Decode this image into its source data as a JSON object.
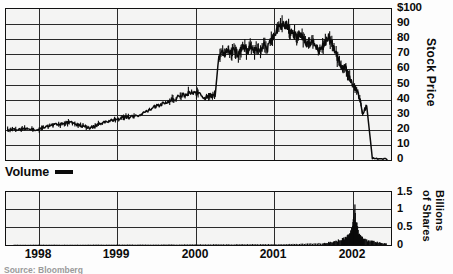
{
  "legend": {
    "label": "Volume",
    "swatch_name": "volume-line-swatch"
  },
  "source": {
    "text": "Source: Bloomberg"
  },
  "price_axis": {
    "title": "Stock Price",
    "ticks": [
      "$100",
      "90",
      "80",
      "70",
      "60",
      "50",
      "40",
      "30",
      "20",
      "10",
      "0"
    ]
  },
  "volume_axis": {
    "title_line1": "Billions",
    "title_line2": "of Shares",
    "ticks": [
      "1.5",
      "1",
      "0.5",
      "0"
    ]
  },
  "x_axis": {
    "ticks": [
      "1998",
      "1999",
      "2000",
      "2001",
      "2002"
    ]
  },
  "colors": {
    "ink": "#0b0b0b",
    "grid": "#2a2a2a",
    "plot_background": "#f4f4f3",
    "page_background": "#fdfdfd"
  },
  "chart_data": [
    {
      "type": "line",
      "title": "Stock Price",
      "xlabel": "",
      "ylabel": "Stock Price",
      "xlim": [
        1997.6,
        2002.35
      ],
      "ylim": [
        0,
        100
      ],
      "grid": true,
      "legend_position": "below-plot-left",
      "yticks": [
        0,
        10,
        20,
        30,
        40,
        50,
        60,
        70,
        80,
        90,
        100
      ],
      "ytick_labels": [
        "0",
        "10",
        "20",
        "30",
        "40",
        "50",
        "60",
        "70",
        "80",
        "90",
        "$100"
      ],
      "xticks": [
        1998,
        1999,
        2000,
        2001,
        2002
      ],
      "xtick_labels": [
        "1998",
        "1999",
        "2000",
        "2001",
        "2002"
      ],
      "series": [
        {
          "name": "Stock Price",
          "x": [
            1997.62,
            1997.68,
            1997.74,
            1997.8,
            1997.86,
            1997.92,
            1997.98,
            1998.04,
            1998.1,
            1998.16,
            1998.22,
            1998.28,
            1998.34,
            1998.4,
            1998.46,
            1998.52,
            1998.58,
            1998.64,
            1998.7,
            1998.76,
            1998.82,
            1998.88,
            1998.94,
            1999.0,
            1999.06,
            1999.12,
            1999.18,
            1999.24,
            1999.3,
            1999.36,
            1999.42,
            1999.48,
            1999.54,
            1999.6,
            1999.66,
            1999.72,
            1999.78,
            1999.84,
            1999.9,
            1999.96,
            2000.02,
            2000.06,
            2000.1,
            2000.14,
            2000.18,
            2000.22,
            2000.26,
            2000.3,
            2000.34,
            2000.38,
            2000.42,
            2000.46,
            2000.5,
            2000.54,
            2000.58,
            2000.62,
            2000.66,
            2000.7,
            2000.74,
            2000.78,
            2000.82,
            2000.86,
            2000.9,
            2000.94,
            2000.98,
            2001.02,
            2001.06,
            2001.1,
            2001.14,
            2001.18,
            2001.22,
            2001.26,
            2001.3,
            2001.34,
            2001.38,
            2001.42,
            2001.46,
            2001.5,
            2001.54,
            2001.58,
            2001.62,
            2001.66,
            2001.7,
            2001.74,
            2001.78,
            2001.82,
            2001.86,
            2001.9,
            2001.94,
            2001.97,
            2002.0,
            2002.05,
            2002.12,
            2002.2,
            2002.3
          ],
          "y": [
            20,
            20.5,
            20,
            20.5,
            21,
            20.5,
            20,
            21,
            22,
            23,
            24,
            23.5,
            24.5,
            25,
            24,
            23,
            22,
            21,
            22.5,
            24,
            25,
            26,
            27,
            27.5,
            28,
            28.5,
            29,
            30,
            31.5,
            33,
            35,
            36,
            37.5,
            39,
            40,
            41.5,
            43,
            44,
            45,
            44,
            42.5,
            41,
            42,
            43,
            42,
            66,
            72,
            70,
            73,
            71,
            74,
            70,
            73,
            76,
            72,
            75,
            71,
            74,
            72,
            76,
            73,
            78,
            82,
            86,
            88,
            89,
            90,
            86,
            84,
            81,
            83,
            80,
            78,
            76,
            79,
            75,
            72,
            74,
            78,
            81,
            77,
            72,
            66,
            60,
            63,
            56,
            52,
            48,
            44,
            39,
            30,
            36,
            1,
            0.5,
            0.4,
            0.3
          ]
        }
      ]
    },
    {
      "type": "bar",
      "title": "Volume",
      "xlabel": "",
      "ylabel": "Billions of Shares",
      "xlim": [
        1997.6,
        2002.35
      ],
      "ylim": [
        0,
        1.5
      ],
      "grid": true,
      "yticks": [
        0,
        0.5,
        1,
        1.5
      ],
      "ytick_labels": [
        "0",
        "0.5",
        "1",
        "1.5"
      ],
      "xticks": [
        1998,
        1999,
        2000,
        2001,
        2002
      ],
      "xtick_labels": [
        "1998",
        "1999",
        "2000",
        "2001",
        "2002"
      ],
      "series": [
        {
          "name": "Volume",
          "x": [
            1997.7,
            1997.8,
            1997.9,
            1998.0,
            1998.1,
            1998.2,
            1998.3,
            1998.4,
            1998.5,
            1998.6,
            1998.7,
            1998.8,
            1998.9,
            1999.0,
            1999.1,
            1999.2,
            1999.3,
            1999.4,
            1999.5,
            1999.6,
            1999.7,
            1999.8,
            1999.9,
            2000.0,
            2000.1,
            2000.2,
            2000.3,
            2000.4,
            2000.5,
            2000.6,
            2000.7,
            2000.8,
            2000.9,
            2001.0,
            2001.1,
            2001.2,
            2001.3,
            2001.4,
            2001.5,
            2001.55,
            2001.6,
            2001.65,
            2001.7,
            2001.75,
            2001.78,
            2001.81,
            2001.84,
            2001.86,
            2001.88,
            2001.9,
            2001.92,
            2001.94,
            2001.96,
            2001.98,
            2002.0,
            2002.05,
            2002.1,
            2002.15,
            2002.2,
            2002.25,
            2002.3
          ],
          "y": [
            0.008,
            0.008,
            0.009,
            0.008,
            0.01,
            0.009,
            0.008,
            0.01,
            0.009,
            0.01,
            0.011,
            0.01,
            0.012,
            0.011,
            0.012,
            0.013,
            0.012,
            0.014,
            0.013,
            0.015,
            0.014,
            0.016,
            0.015,
            0.018,
            0.017,
            0.019,
            0.018,
            0.02,
            0.019,
            0.021,
            0.02,
            0.022,
            0.021,
            0.025,
            0.028,
            0.03,
            0.035,
            0.04,
            0.05,
            0.06,
            0.08,
            0.1,
            0.13,
            0.17,
            0.2,
            0.26,
            0.33,
            0.42,
            0.55,
            0.98,
            0.62,
            0.38,
            0.28,
            0.22,
            0.18,
            0.14,
            0.11,
            0.09,
            0.07,
            0.05,
            0.04
          ]
        }
      ]
    }
  ]
}
